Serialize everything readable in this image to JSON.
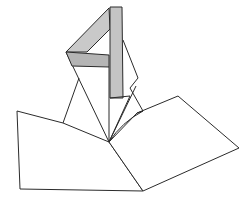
{
  "diagram": {
    "title": "",
    "watermark_text": "",
    "colors": {
      "stroke": "#2b2b2b",
      "paper": "#ffffff",
      "strip_fill": "#c9c9c9",
      "strip_shade": "#b5b5b5"
    },
    "parts": [
      {
        "name": "left-base-panel"
      },
      {
        "name": "right-base-panel"
      },
      {
        "name": "vertical-strip"
      },
      {
        "name": "diagonal-strip"
      },
      {
        "name": "horizontal-strip"
      },
      {
        "name": "left-kite-flap"
      },
      {
        "name": "right-kite-flap"
      }
    ]
  }
}
